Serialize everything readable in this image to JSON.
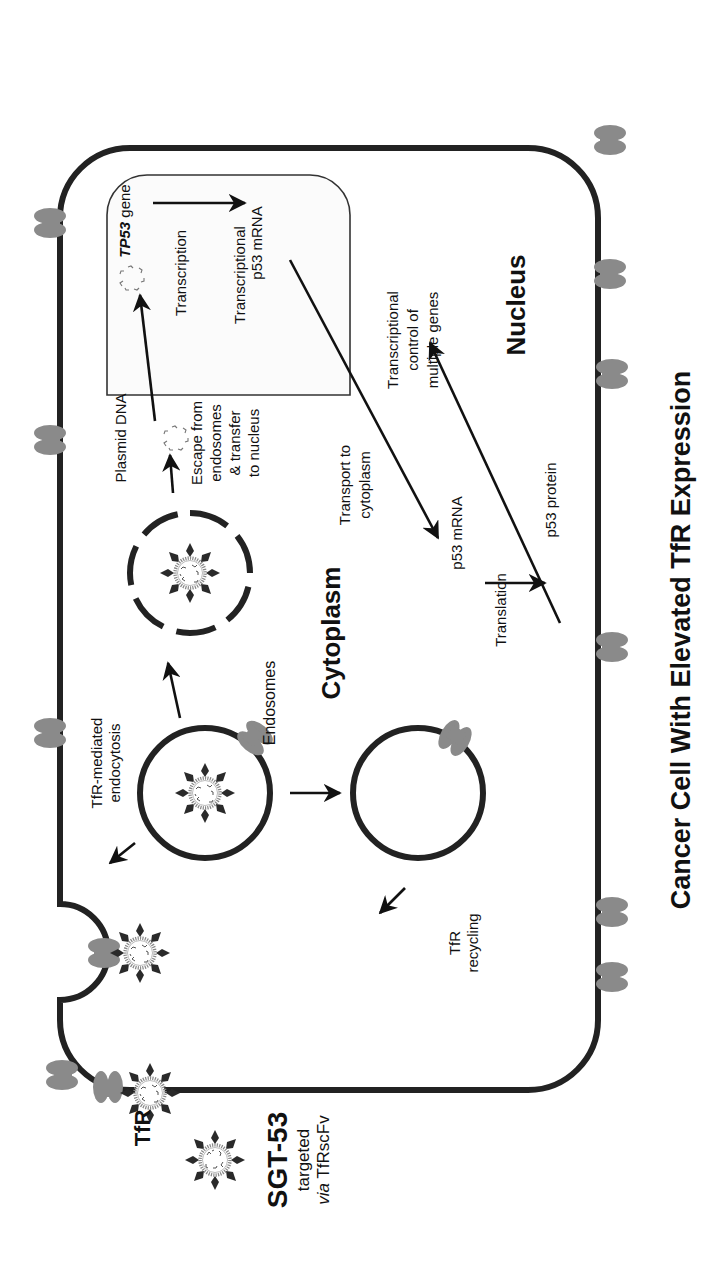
{
  "title": "Cancer Cell With Elevated TfR Expression",
  "legend": {
    "name": "SGT-53",
    "line1": "targeted",
    "line2_italic": "via",
    "line2_rest": " TfRscFv"
  },
  "labels": {
    "tfr": "TfR",
    "tfr_endocytosis_1": "TfR-mediated",
    "tfr_endocytosis_2": "endocytosis",
    "endosomes": "Endosomes",
    "cytoplasm": "Cytoplasm",
    "tfr_recycling_1": "TfR",
    "tfr_recycling_2": "recycling",
    "plasmid_dna": "Plasmid DNA",
    "escape_1": "Escape from",
    "escape_2": "endosomes",
    "escape_3": "& transfer",
    "escape_4": "to nucleus",
    "tp53_gene_italic": "TP53",
    "tp53_gene_rest": " gene",
    "transcription": "Transcription",
    "p53_mrna_nucleus": "p53 mRNA",
    "transcriptional_1": "Transcriptional",
    "transcriptional_2": "control of",
    "transcriptional_3": "multiple genes",
    "nucleus": "Nucleus",
    "transport_1": "Transport to",
    "transport_2": "cytoplasm",
    "p53_mrna_cyto": "p53 mRNA",
    "translation": "Translation",
    "p53_protein": "p53 protein"
  },
  "colors": {
    "membrane": "#222222",
    "receptor": "#8a8a8a",
    "text": "#111111",
    "background": "#ffffff"
  }
}
